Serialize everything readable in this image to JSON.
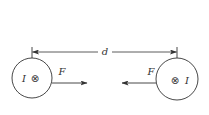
{
  "diagram": {
    "distance_label": "d",
    "wires": [
      {
        "id": "left",
        "current_label": "I",
        "current_direction_symbol": "⊗",
        "current_direction": "into-page",
        "force_label": "F",
        "force_direction": "right"
      },
      {
        "id": "right",
        "current_label": "I",
        "current_direction_symbol": "⊗",
        "current_direction": "into-page",
        "force_label": "F",
        "force_direction": "left"
      }
    ],
    "colors": {
      "line": "#333333",
      "background": "#ffffff"
    }
  }
}
